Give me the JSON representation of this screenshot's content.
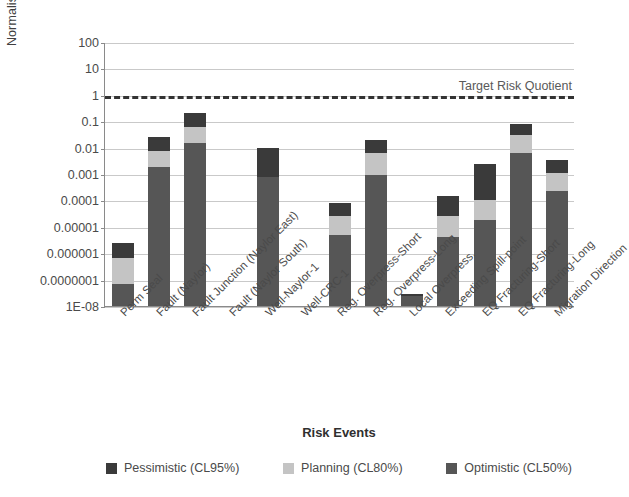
{
  "chart_data": {
    "type": "bar",
    "subtype": "stacked-bar-log",
    "title": "",
    "xlabel": "Risk Events",
    "ylabel": "Normalised Risk Quotient",
    "ylim": [
      1e-08,
      100
    ],
    "y_scale": "log",
    "grid": true,
    "legend_position": "bottom",
    "y_tick_labels": [
      "100",
      "10",
      "1",
      "0.1",
      "0.01",
      "0.001",
      "0.0001",
      "0.00001",
      "0.000001",
      "0.0000001",
      "1E-08"
    ],
    "y_tick_values": [
      100,
      10,
      1,
      0.1,
      0.01,
      0.001,
      0.0001,
      1e-05,
      1e-06,
      1e-07,
      1e-08
    ],
    "categories": [
      "Perm Seal",
      "Fault (Naylor)",
      "Fault Junction (Naylor East)",
      "Fault (Naylor South)",
      "Well-Naylor-1",
      "Well-CRC-1",
      "Reg. Overpress-Short",
      "Reg. Overpress-Long",
      "Local Overpress.",
      "Exceeding Spill-point",
      "EQ Fracturing-Short",
      "EQ Fracturing-Long",
      "Migration Direction"
    ],
    "series": [
      {
        "name": "Optimistic (CL50%)",
        "color": "#565656",
        "values": [
          7e-08,
          0.0018,
          0.015,
          null,
          0.0008,
          null,
          5e-06,
          0.0009,
          2.5e-08,
          4e-06,
          1.8e-05,
          0.0065,
          0.00022
        ]
      },
      {
        "name": "Planning (CL80%)",
        "color": "#c4c4c4",
        "values": [
          6.5e-07,
          0.0075,
          0.06,
          null,
          null,
          null,
          2.5e-05,
          0.006,
          null,
          2.5e-05,
          0.0001,
          0.03,
          0.0011
        ]
      },
      {
        "name": "Pessimistic (CL95%)",
        "color": "#3a3a3a",
        "values": [
          2.5e-06,
          0.026,
          0.2,
          null,
          0.01,
          null,
          8e-05,
          0.02,
          2.8e-08,
          0.00015,
          0.0025,
          0.08,
          0.0035
        ]
      }
    ],
    "annotations": [
      {
        "label": "Target Risk Quotient",
        "type": "hline",
        "value": 1,
        "style": "dashed",
        "color": "#333333"
      }
    ]
  },
  "legend": {
    "items": [
      {
        "label": "Pessimistic (CL95%)",
        "color": "#3a3a3a",
        "swatch_name": "legend-swatch-pessimistic"
      },
      {
        "label": "Planning (CL80%)",
        "color": "#c4c4c4",
        "swatch_name": "legend-swatch-planning"
      },
      {
        "label": "Optimistic (CL50%)",
        "color": "#565656",
        "swatch_name": "legend-swatch-optimistic"
      }
    ]
  },
  "axis_titles": {
    "x": "Risk Events",
    "y": "Normalised Risk Quotient"
  },
  "target_line_label": "Target Risk Quotient"
}
